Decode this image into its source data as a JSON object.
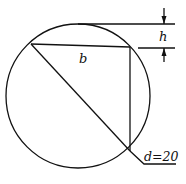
{
  "diagram": {
    "labels": {
      "chord": "b",
      "height": "h",
      "diameter": "d=20"
    },
    "colors": {
      "stroke": "#111111",
      "background": "#ffffff"
    },
    "circle": {
      "cx": 78,
      "cy": 96,
      "r": 72
    }
  }
}
